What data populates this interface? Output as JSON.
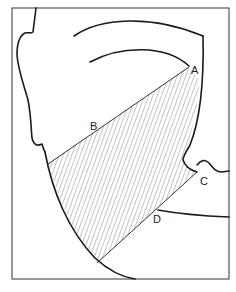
{
  "figure": {
    "type": "anatomical-diagram",
    "labels": {
      "A": "A",
      "B": "B",
      "C": "C",
      "D": "D"
    },
    "colors": {
      "line": "#1a1a1a",
      "hatch": "#555555",
      "background": "#ffffff"
    }
  }
}
